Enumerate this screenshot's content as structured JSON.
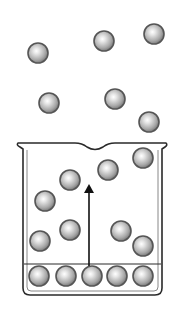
{
  "diagram": {
    "title": "",
    "colors": {
      "outline": "#2a2a2a",
      "particle_edge": "#555555",
      "particle_fill_light": "#f4f4f4",
      "particle_fill_dark": "#8a8a8a",
      "background": "#ffffff"
    },
    "particle_radius": 10,
    "gas_particles_above": [
      {
        "x": 38,
        "y": 53
      },
      {
        "x": 104,
        "y": 41
      },
      {
        "x": 154,
        "y": 34
      },
      {
        "x": 49,
        "y": 103
      },
      {
        "x": 115,
        "y": 99
      },
      {
        "x": 149,
        "y": 122
      }
    ],
    "gas_particles_in_beaker": [
      {
        "x": 70,
        "y": 180
      },
      {
        "x": 108,
        "y": 170
      },
      {
        "x": 143,
        "y": 158
      },
      {
        "x": 45,
        "y": 201
      },
      {
        "x": 70,
        "y": 230
      },
      {
        "x": 121,
        "y": 231
      },
      {
        "x": 40,
        "y": 241
      },
      {
        "x": 143,
        "y": 246
      }
    ],
    "liquid_layer_particles": [
      {
        "x": 39,
        "y": 276
      },
      {
        "x": 66,
        "y": 276
      },
      {
        "x": 92,
        "y": 276
      },
      {
        "x": 117,
        "y": 276
      },
      {
        "x": 143,
        "y": 276
      }
    ],
    "arrow": {
      "x": 89,
      "y_start": 266,
      "y_end": 184,
      "direction": "up"
    }
  }
}
